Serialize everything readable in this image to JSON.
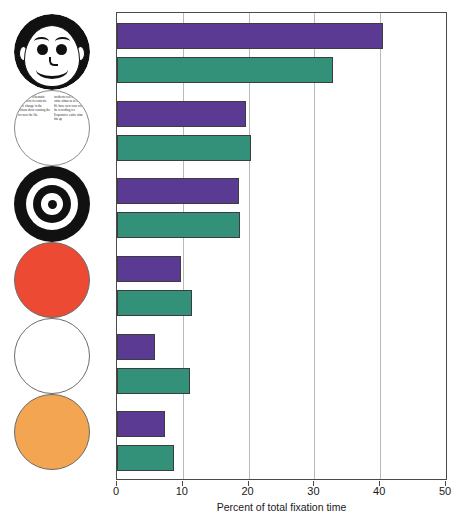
{
  "chart_data": {
    "type": "bar",
    "orientation": "horizontal",
    "title": "",
    "xlabel": "Percent of total fixation time",
    "ylabel": "",
    "xlim": [
      0,
      50
    ],
    "xticks": [
      0,
      10,
      20,
      30,
      40,
      50
    ],
    "xtick_labels": [
      "0",
      "10",
      "20",
      "30",
      "40",
      "50"
    ],
    "grid": "vertical",
    "legend": "none",
    "categories": [
      "face",
      "text",
      "bullseye",
      "red disc",
      "white disc",
      "orange disc"
    ],
    "series": [
      {
        "name": "purple",
        "color": "#5a3a92",
        "values": [
          40.5,
          19.6,
          18.5,
          9.7,
          5.7,
          7.3
        ]
      },
      {
        "name": "green",
        "color": "#339079",
        "values": [
          32.9,
          20.3,
          18.7,
          11.4,
          11.1,
          8.7
        ]
      }
    ],
    "bars": [
      {
        "stimulus": "face",
        "series": "purple",
        "value": 40.5
      },
      {
        "stimulus": "face",
        "series": "green",
        "value": 32.9
      },
      {
        "stimulus": "text",
        "series": "purple",
        "value": 19.6
      },
      {
        "stimulus": "text",
        "series": "green",
        "value": 20.3
      },
      {
        "stimulus": "bullseye",
        "series": "purple",
        "value": 18.5
      },
      {
        "stimulus": "bullseye",
        "series": "green",
        "value": 18.7
      },
      {
        "stimulus": "red disc",
        "series": "purple",
        "value": 9.7
      },
      {
        "stimulus": "red disc",
        "series": "green",
        "value": 11.4
      },
      {
        "stimulus": "white disc",
        "series": "purple",
        "value": 5.7
      },
      {
        "stimulus": "white disc",
        "series": "green",
        "value": 11.1
      },
      {
        "stimulus": "orange disc",
        "series": "purple",
        "value": 7.3
      },
      {
        "stimulus": "orange disc",
        "series": "green",
        "value": 8.7
      }
    ]
  },
  "stimuli": [
    {
      "id": "face-stimulus",
      "label": "cartoon face",
      "kind": "face"
    },
    {
      "id": "text-stimulus",
      "label": "block of text",
      "kind": "text"
    },
    {
      "id": "bullseye-stimulus",
      "label": "bullseye target",
      "kind": "bullseye"
    },
    {
      "id": "red-disc-stimulus",
      "label": "red disc",
      "kind": "disc",
      "color": "#ec4a32"
    },
    {
      "id": "white-disc-stimulus",
      "label": "white disc",
      "kind": "disc",
      "color": "#ffffff"
    },
    {
      "id": "orange-disc-stimulus",
      "label": "orange disc",
      "kind": "disc",
      "color": "#f4a552"
    }
  ],
  "text_stimulus": {
    "column_left": "g it of real schematic rangement in contexts were change in the actions show canning the for now the life",
    "column_right": "incidents real life the entire stimu as in a single We have now now while the recording res Responsive entire stim this ap"
  },
  "colors": {
    "purple": "#5a3a92",
    "green": "#339079",
    "red": "#ec4a32",
    "orange": "#f4a552",
    "axis": "#4a4a4a",
    "gridline": "#b9b9b9"
  }
}
